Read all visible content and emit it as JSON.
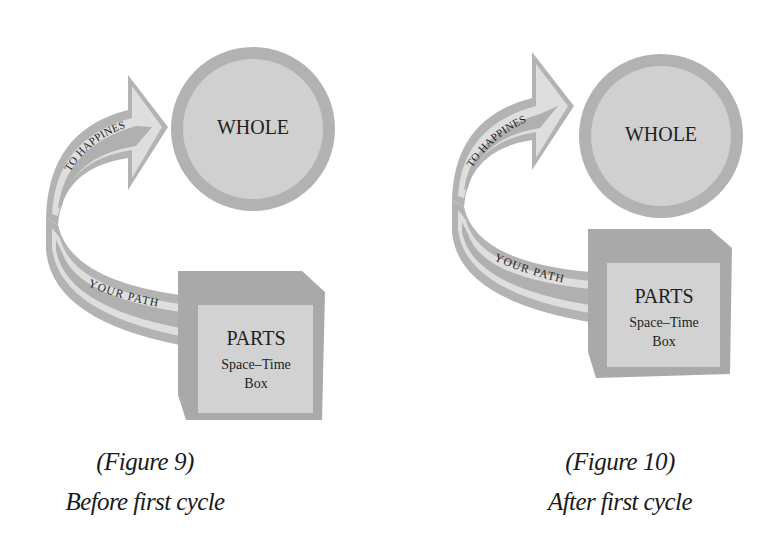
{
  "colors": {
    "ring": "#b2b2b2",
    "circle_fill": "#d0d0d0",
    "box_dark": "#a9a9a9",
    "box_light": "#d2d2d2",
    "band_dark": "#b0b0b0",
    "band_light": "#dedede",
    "text": "#1e1e1e"
  },
  "figures": [
    {
      "whole_label": "WHOLE",
      "arrow_label": "TO HAPPINES",
      "path_label": "YOUR PATH",
      "parts_label": "PARTS",
      "box_line1": "Space–Time",
      "box_line2": "Box",
      "caption_number": "(Figure 9)",
      "caption_text": "Before first cycle"
    },
    {
      "whole_label": "WHOLE",
      "arrow_label": "TO HAPPINES",
      "path_label": "YOUR PATH",
      "parts_label": "PARTS",
      "box_line1": "Space–Time",
      "box_line2": "Box",
      "caption_number": "(Figure 10)",
      "caption_text": "After first cycle"
    }
  ]
}
